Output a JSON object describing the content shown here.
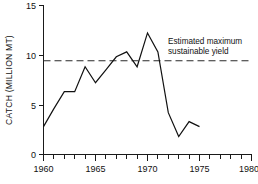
{
  "chart_data": {
    "type": "line",
    "title": "",
    "xlabel": "",
    "ylabel": "CATCH (MILLION MT)",
    "xlim": [
      1960,
      1980
    ],
    "ylim": [
      0,
      15
    ],
    "grid": false,
    "legend": "none",
    "x_ticks_major": [
      1960,
      1965,
      1970,
      1975,
      1980
    ],
    "x_tick_labels": [
      "1960",
      "1965",
      "1970",
      "1975",
      "1980"
    ],
    "x_minor_tick_step": 1,
    "y_ticks": [
      0,
      5,
      10,
      15
    ],
    "y_tick_labels": [
      "0",
      "5",
      "10",
      "15"
    ],
    "series": [
      {
        "name": "Catch",
        "style": "solid",
        "x": [
          1960,
          1961,
          1962,
          1963,
          1964,
          1965,
          1966,
          1967,
          1968,
          1969,
          1970,
          1971,
          1972,
          1973,
          1974,
          1975
        ],
        "values": [
          2.8,
          4.6,
          6.3,
          6.3,
          8.8,
          7.2,
          8.5,
          9.8,
          10.3,
          8.8,
          12.2,
          10.3,
          4.2,
          1.8,
          3.3,
          2.8
        ]
      }
    ],
    "reference_lines": [
      {
        "name": "Estimated maximum sustainable yield",
        "orientation": "horizontal",
        "value": 9.4,
        "style": "dashed",
        "x_start": 1960,
        "x_end": 1980
      }
    ],
    "annotations": [
      {
        "name": "msy-annotation",
        "line1": "Estimated maximum",
        "line2": "sustainable yield",
        "x": 1971.3,
        "y": 11.3
      }
    ],
    "colors": {
      "data_line": "#111111",
      "reference_line": "#2b2b2b",
      "axis": "#1a1a1a",
      "background": "#ffffff"
    }
  }
}
